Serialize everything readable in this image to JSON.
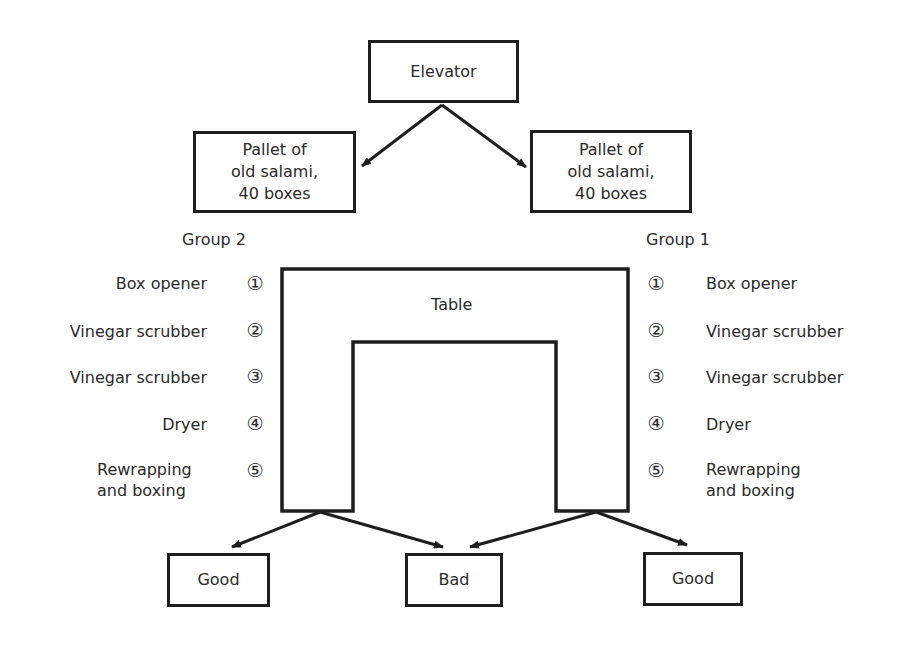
{
  "diagram": {
    "elevator": "Elevator",
    "pallet_left": [
      "Pallet of",
      "old salami,",
      "40 boxes"
    ],
    "pallet_right": [
      "Pallet of",
      "old salami,",
      "40 boxes"
    ],
    "table_label": "Table",
    "group_left": {
      "title": "Group 2",
      "stations": [
        {
          "num": "①",
          "label": "Box opener"
        },
        {
          "num": "②",
          "label": "Vinegar scrubber"
        },
        {
          "num": "③",
          "label": "Vinegar scrubber"
        },
        {
          "num": "④",
          "label": "Dryer"
        },
        {
          "num": "⑤",
          "label": "Rewrapping",
          "label2": "and boxing"
        }
      ]
    },
    "group_right": {
      "title": "Group 1",
      "stations": [
        {
          "num": "①",
          "label": "Box opener"
        },
        {
          "num": "②",
          "label": "Vinegar scrubber"
        },
        {
          "num": "③",
          "label": "Vinegar scrubber"
        },
        {
          "num": "④",
          "label": "Dryer"
        },
        {
          "num": "⑤",
          "label": "Rewrapping",
          "label2": "and boxing"
        }
      ]
    },
    "outputs": {
      "good_left": "Good",
      "bad": "Bad",
      "good_right": "Good"
    }
  }
}
